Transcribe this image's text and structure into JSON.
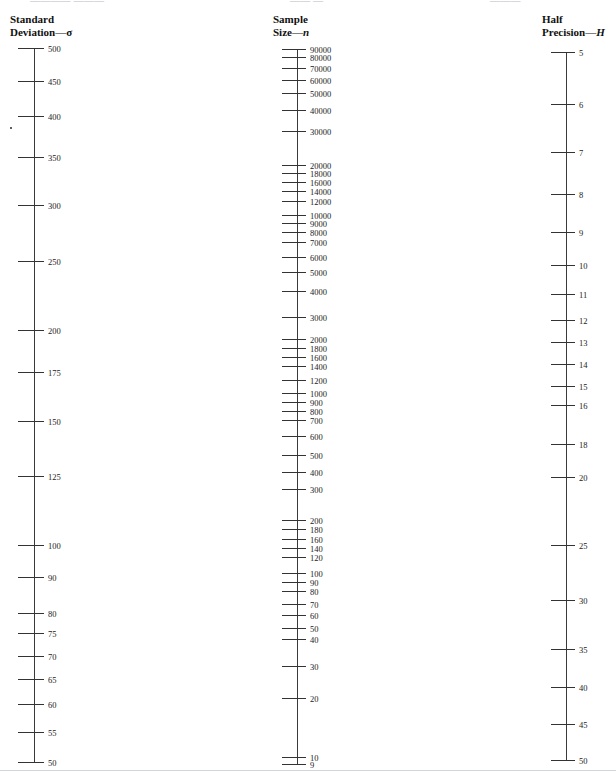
{
  "page": {
    "top_clipped_text": "clipped running head",
    "bottom_rule": true
  },
  "chart_data": {
    "type": "nomogram",
    "grid": false,
    "legend": "none",
    "axes": [
      {
        "id": "standard-deviation",
        "title_line1": "Standard",
        "title_line2_prefix": "Deviation",
        "title_line2_dash": "—",
        "title_symbol": "σ",
        "symbol_style": "greek",
        "x": 34,
        "top": 48,
        "bottom": 762,
        "label_side": "right",
        "ticks": [
          {
            "value": 500,
            "y": 48,
            "len": 26,
            "major": true
          },
          {
            "value": 450,
            "y": 81,
            "len": 26,
            "major": true
          },
          {
            "value": 400,
            "y": 116,
            "len": 26,
            "major": true
          },
          {
            "value": 350,
            "y": 157,
            "len": 26,
            "major": true
          },
          {
            "value": 300,
            "y": 205,
            "len": 26,
            "major": true
          },
          {
            "value": 250,
            "y": 261,
            "len": 26,
            "major": true
          },
          {
            "value": 200,
            "y": 330,
            "len": 26,
            "major": true
          },
          {
            "value": 175,
            "y": 372,
            "len": 26,
            "major": true
          },
          {
            "value": 150,
            "y": 421,
            "len": 26,
            "major": true
          },
          {
            "value": 125,
            "y": 476,
            "len": 26,
            "major": true
          },
          {
            "value": 100,
            "y": 545,
            "len": 26,
            "major": true
          },
          {
            "value": 90,
            "y": 577,
            "len": 26,
            "major": true
          },
          {
            "value": 80,
            "y": 613,
            "len": 26,
            "major": true
          },
          {
            "value": 75,
            "y": 633,
            "len": 26,
            "major": true
          },
          {
            "value": 70,
            "y": 656,
            "len": 26,
            "major": true
          },
          {
            "value": 65,
            "y": 679,
            "len": 26,
            "major": true
          },
          {
            "value": 60,
            "y": 704,
            "len": 26,
            "major": true
          },
          {
            "value": 55,
            "y": 732,
            "len": 26,
            "major": true
          },
          {
            "value": 50,
            "y": 762,
            "len": 26,
            "major": true
          }
        ],
        "speck": {
          "x": 10,
          "y": 127
        }
      },
      {
        "id": "sample-size",
        "title_line1": "Sample",
        "title_line2_prefix": "Size",
        "title_line2_dash": "—",
        "title_symbol": "n",
        "symbol_style": "italic",
        "x": 297,
        "top": 49,
        "bottom": 764,
        "label_side": "right",
        "ticks": [
          {
            "value": 90000,
            "y": 49,
            "len": 24,
            "major": true
          },
          {
            "value": 80000,
            "y": 57,
            "len": 24,
            "major": true
          },
          {
            "value": 70000,
            "y": 68,
            "len": 24,
            "major": true
          },
          {
            "value": 60000,
            "y": 80,
            "len": 24,
            "major": true
          },
          {
            "value": 50000,
            "y": 93,
            "len": 24,
            "major": true
          },
          {
            "value": 40000,
            "y": 110,
            "len": 24,
            "major": true
          },
          {
            "value": 30000,
            "y": 131,
            "len": 24,
            "major": true
          },
          {
            "value": 20000,
            "y": 165,
            "len": 24,
            "major": true
          },
          {
            "value": 18000,
            "y": 173,
            "len": 24,
            "major": true
          },
          {
            "value": 16000,
            "y": 182,
            "len": 24,
            "major": true
          },
          {
            "value": 14000,
            "y": 191,
            "len": 24,
            "major": true
          },
          {
            "value": 12000,
            "y": 201,
            "len": 24,
            "major": true
          },
          {
            "value": 10000,
            "y": 215,
            "len": 24,
            "major": true
          },
          {
            "value": 9000,
            "y": 223,
            "len": 24,
            "major": true
          },
          {
            "value": 8000,
            "y": 232,
            "len": 24,
            "major": true
          },
          {
            "value": 7000,
            "y": 242,
            "len": 24,
            "major": true
          },
          {
            "value": 6000,
            "y": 257,
            "len": 24,
            "major": true
          },
          {
            "value": 5000,
            "y": 272,
            "len": 24,
            "major": true
          },
          {
            "value": 4000,
            "y": 291,
            "len": 24,
            "major": true
          },
          {
            "value": 3000,
            "y": 317,
            "len": 24,
            "major": true
          },
          {
            "value": 2000,
            "y": 339,
            "len": 24,
            "major": true
          },
          {
            "value": 1800,
            "y": 348,
            "len": 24,
            "major": true
          },
          {
            "value": 1600,
            "y": 357,
            "len": 24,
            "major": true
          },
          {
            "value": 1400,
            "y": 366,
            "len": 24,
            "major": true
          },
          {
            "value": 1200,
            "y": 380,
            "len": 24,
            "major": true
          },
          {
            "value": 1000,
            "y": 393,
            "len": 24,
            "major": true
          },
          {
            "value": 900,
            "y": 402,
            "len": 24,
            "major": true
          },
          {
            "value": 800,
            "y": 411,
            "len": 24,
            "major": true
          },
          {
            "value": 700,
            "y": 420,
            "len": 24,
            "major": true
          },
          {
            "value": 600,
            "y": 436,
            "len": 24,
            "major": true
          },
          {
            "value": 500,
            "y": 455,
            "len": 24,
            "major": true
          },
          {
            "value": 400,
            "y": 472,
            "len": 24,
            "major": true
          },
          {
            "value": 300,
            "y": 489,
            "len": 24,
            "major": true
          },
          {
            "value": 200,
            "y": 520,
            "len": 24,
            "major": true
          },
          {
            "value": 180,
            "y": 529,
            "len": 24,
            "major": true
          },
          {
            "value": 160,
            "y": 539,
            "len": 24,
            "major": true
          },
          {
            "value": 140,
            "y": 548,
            "len": 24,
            "major": true
          },
          {
            "value": 120,
            "y": 557,
            "len": 24,
            "major": true
          },
          {
            "value": 100,
            "y": 573,
            "len": 24,
            "major": true
          },
          {
            "value": 90,
            "y": 582,
            "len": 24,
            "major": true
          },
          {
            "value": 80,
            "y": 591,
            "len": 24,
            "major": true
          },
          {
            "value": 70,
            "y": 604,
            "len": 24,
            "major": true
          },
          {
            "value": 60,
            "y": 615,
            "len": 24,
            "major": true
          },
          {
            "value": 50,
            "y": 628,
            "len": 24,
            "major": true
          },
          {
            "value": 40,
            "y": 639,
            "len": 24,
            "major": true
          },
          {
            "value": 30,
            "y": 666,
            "len": 24,
            "major": true
          },
          {
            "value": 20,
            "y": 698,
            "len": 24,
            "major": true
          },
          {
            "value": 10,
            "y": 757,
            "len": 24,
            "major": true
          },
          {
            "value": 9,
            "y": 764,
            "len": 24,
            "major": true
          }
        ]
      },
      {
        "id": "half-precision",
        "title_line1": "Half",
        "title_line2_prefix": "Precision",
        "title_line2_dash": "—",
        "title_symbol": "H",
        "symbol_style": "italic",
        "x": 566,
        "top": 52,
        "bottom": 760,
        "label_side": "right",
        "ticks": [
          {
            "value": 5,
            "y": 52,
            "len": 24,
            "major": true
          },
          {
            "value": 6,
            "y": 104,
            "len": 24,
            "major": true
          },
          {
            "value": 7,
            "y": 152,
            "len": 24,
            "major": true
          },
          {
            "value": 8,
            "y": 194,
            "len": 24,
            "major": true
          },
          {
            "value": 9,
            "y": 232,
            "len": 24,
            "major": true
          },
          {
            "value": 10,
            "y": 265,
            "len": 24,
            "major": true
          },
          {
            "value": 11,
            "y": 294,
            "len": 24,
            "major": true
          },
          {
            "value": 12,
            "y": 320,
            "len": 24,
            "major": true
          },
          {
            "value": 13,
            "y": 342,
            "len": 24,
            "major": true
          },
          {
            "value": 14,
            "y": 364,
            "len": 24,
            "major": true
          },
          {
            "value": 15,
            "y": 386,
            "len": 24,
            "major": true
          },
          {
            "value": 16,
            "y": 405,
            "len": 24,
            "major": true
          },
          {
            "value": 18,
            "y": 444,
            "len": 24,
            "major": true
          },
          {
            "value": 20,
            "y": 477,
            "len": 24,
            "major": true
          },
          {
            "value": 25,
            "y": 545,
            "len": 24,
            "major": true
          },
          {
            "value": 30,
            "y": 600,
            "len": 24,
            "major": true
          },
          {
            "value": 35,
            "y": 649,
            "len": 24,
            "major": true
          },
          {
            "value": 40,
            "y": 687,
            "len": 24,
            "major": true
          },
          {
            "value": 45,
            "y": 724,
            "len": 24,
            "major": true
          },
          {
            "value": 50,
            "y": 760,
            "len": 24,
            "major": true
          }
        ]
      }
    ]
  }
}
